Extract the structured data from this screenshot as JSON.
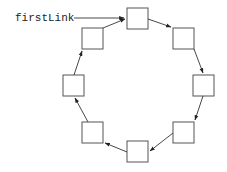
{
  "diagram": {
    "pointer": {
      "label": "firstLink",
      "target_node": 0
    },
    "nodes": [
      {
        "id": 0,
        "position": "top"
      },
      {
        "id": 1,
        "position": "top-right"
      },
      {
        "id": 2,
        "position": "right"
      },
      {
        "id": 3,
        "position": "bottom-right"
      },
      {
        "id": 4,
        "position": "bottom"
      },
      {
        "id": 5,
        "position": "bottom-left"
      },
      {
        "id": 6,
        "position": "left"
      },
      {
        "id": 7,
        "position": "top-left"
      }
    ],
    "edges": [
      {
        "from": 0,
        "to": 1
      },
      {
        "from": 1,
        "to": 2
      },
      {
        "from": 2,
        "to": 3
      },
      {
        "from": 3,
        "to": 4
      },
      {
        "from": 4,
        "to": 5
      },
      {
        "from": 5,
        "to": 6
      },
      {
        "from": 6,
        "to": 7
      },
      {
        "from": 7,
        "to": 0
      }
    ],
    "colors": {
      "node_stroke": "#555555",
      "edge": "#333333",
      "text": "#222222",
      "background": "#ffffff"
    }
  }
}
